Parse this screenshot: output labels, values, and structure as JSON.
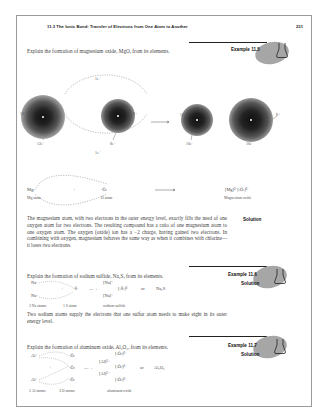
{
  "header": {
    "running_title": "11.3  The Ionic Bond: Transfer of Electrons from One Atom to Another",
    "page_number": "231"
  },
  "example_11_5": {
    "label": "Example 11.5",
    "question": "Explain the formation of magnesium oxide, MgO, from its elements.",
    "diagram": {
      "transfer_top": "1e⁻",
      "transfer_bottom": "1e⁻",
      "mg_nucleus": "12+",
      "mg_electrons": "12e⁻",
      "o_nucleus": "8+",
      "o_electrons": "8e⁻",
      "mg_ion_nucleus": "12+",
      "mg_ion_electrons": "10e⁻",
      "o_ion_nucleus": "8+",
      "o_ion_electrons": "10e⁻",
      "mg_symbol": "Mg:",
      "plus": "+",
      "o_symbol": "·Ö:",
      "mg_atom_label": "Mg atom",
      "o_atom_label": "O atom",
      "product_formula": "[Mg]²⁺[:Ö:]²⁻",
      "product_label": "Magnesium oxide"
    },
    "solution_label": "Solution",
    "solution_text": "The magnesium atom, with two electrons in the outer energy level, exactly fills the need of one oxygen atom for two electrons. The resulting compound has a ratio of one magnesium atom to one oxygen atom. The oxygen (oxide) ion has a −2 charge, having gained two electrons. In combining with oxygen, magnesium behaves the same way as when it combines with chlorine—it loses two electrons."
  },
  "example_11_6": {
    "label": "Example 11.6",
    "question": "Explain the formation of sodium sulfide, Na₂S, from its elements.",
    "solution_label": "Solution",
    "diagram": {
      "na1": "Na·",
      "na2": "Na·",
      "plus": "+",
      "s": "·S̈·",
      "arrow": "—→",
      "na_ion1": "[Na]⁺",
      "na_ion2": "[Na]⁺",
      "s_ion": "[:S̈:]²⁻",
      "or": "or",
      "formula": "Na₂S",
      "na_label": "2 Na atoms",
      "s_label": "1 S atom",
      "product_label": "sodium sulfide"
    },
    "solution_text": "Two sodium atoms supply the electrons that one sulfur atom needs to make eight in its outer energy level."
  },
  "example_11_7": {
    "label": "Example 11.7",
    "question": "Explain the formation of aluminum oxide, Al₂O₃, from its elements.",
    "solution_label": "Solution",
    "diagram": {
      "al1": "Al·",
      "al2": "Al·",
      "o1": "·Ö:",
      "o2": "·Ö:",
      "o3": "·Ö:",
      "plus": "+",
      "arrow": "—→",
      "al_ion1": "[Al]³⁺",
      "al_ion2": "[Al]³⁺",
      "o_ion1": "[:Ö:]²⁻",
      "o_ion2": "[:Ö:]²⁻",
      "o_ion3": "[:Ö:]²⁻",
      "or": "or",
      "formula": "Al₂O₃",
      "al_label": "2 Al atoms",
      "o_label": "3 O atoms",
      "product_label": "aluminum oxide"
    }
  },
  "colors": {
    "border": "#9a9a9a",
    "rule": "#222222",
    "tab_blob": "#a6a6a6",
    "text": "#444444"
  }
}
